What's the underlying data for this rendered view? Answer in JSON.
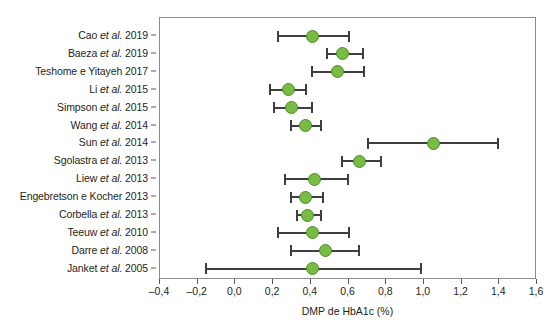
{
  "chart_data": {
    "type": "scatter",
    "subtype": "forest-plot",
    "title": "",
    "xlabel": "DMP de HbA1c (%)",
    "ylabel": "",
    "xlim": [
      -0.4,
      1.6
    ],
    "xticks": [
      -0.4,
      -0.2,
      0.0,
      0.2,
      0.4,
      0.6,
      0.8,
      1.0,
      1.2,
      1.4,
      1.6
    ],
    "xtick_labels": [
      "–0,4",
      "–0,2",
      "0,0",
      "0,2",
      "0,4",
      "0,6",
      "0,8",
      "1,0",
      "1,2",
      "1,4",
      "1,6"
    ],
    "grid": false,
    "legend": false,
    "marker_color": "#78bd43",
    "marker_edge_color": "#4e8a2a",
    "line_color": "#3f3f3f",
    "frame_color": "#8b8c8e",
    "categories": [
      "Cao et al. 2019",
      "Baeza et al. 2019",
      "Teshome e Yitayeh 2017",
      "Li et al. 2015",
      "Simpson et al. 2015",
      "Wang et al. 2014",
      "Sun et al. 2014",
      "Sgolastra et al. 2013",
      "Liew et al. 2013",
      "Engebretson e Kocher 2013",
      "Corbella et al. 2013",
      "Teeuw et al. 2010",
      "Darre et al. 2008",
      "Janket et al. 2005"
    ],
    "studies": [
      {
        "label_pre": "Cao ",
        "label_ital": "et al.",
        "label_post": " 2019",
        "estimate": 0.41,
        "ci_low": 0.22,
        "ci_high": 0.61
      },
      {
        "label_pre": "Baeza ",
        "label_ital": "et al.",
        "label_post": " 2019",
        "estimate": 0.57,
        "ci_low": 0.48,
        "ci_high": 0.68
      },
      {
        "label_pre": "Teshome e Yitayeh 2017",
        "label_ital": "",
        "label_post": "",
        "estimate": 0.54,
        "ci_low": 0.4,
        "ci_high": 0.69
      },
      {
        "label_pre": "Li ",
        "label_ital": "et al.",
        "label_post": " 2015",
        "estimate": 0.28,
        "ci_low": 0.18,
        "ci_high": 0.38
      },
      {
        "label_pre": "Simpson ",
        "label_ital": "et al.",
        "label_post": " 2015",
        "estimate": 0.3,
        "ci_low": 0.2,
        "ci_high": 0.41
      },
      {
        "label_pre": "Wang ",
        "label_ital": "et al.",
        "label_post": " 2014",
        "estimate": 0.37,
        "ci_low": 0.29,
        "ci_high": 0.46
      },
      {
        "label_pre": "Sun ",
        "label_ital": "et al.",
        "label_post": " 2014",
        "estimate": 1.05,
        "ci_low": 0.7,
        "ci_high": 1.4
      },
      {
        "label_pre": "Sgolastra ",
        "label_ital": "et al.",
        "label_post": " 2013",
        "estimate": 0.66,
        "ci_low": 0.56,
        "ci_high": 0.78
      },
      {
        "label_pre": "Liew ",
        "label_ital": "et al.",
        "label_post": " 2013",
        "estimate": 0.42,
        "ci_low": 0.26,
        "ci_high": 0.6
      },
      {
        "label_pre": "Engebretson e Kocher 2013",
        "label_ital": "",
        "label_post": "",
        "estimate": 0.37,
        "ci_low": 0.29,
        "ci_high": 0.47
      },
      {
        "label_pre": "Corbella ",
        "label_ital": "et al.",
        "label_post": " 2013",
        "estimate": 0.38,
        "ci_low": 0.32,
        "ci_high": 0.46
      },
      {
        "label_pre": "Teeuw ",
        "label_ital": "et al.",
        "label_post": " 2010",
        "estimate": 0.41,
        "ci_low": 0.22,
        "ci_high": 0.61
      },
      {
        "label_pre": "Darre ",
        "label_ital": "et al.",
        "label_post": " 2008",
        "estimate": 0.48,
        "ci_low": 0.29,
        "ci_high": 0.66
      },
      {
        "label_pre": "Janket ",
        "label_ital": "et al.",
        "label_post": " 2005",
        "estimate": 0.41,
        "ci_low": -0.16,
        "ci_high": 0.99
      }
    ]
  }
}
